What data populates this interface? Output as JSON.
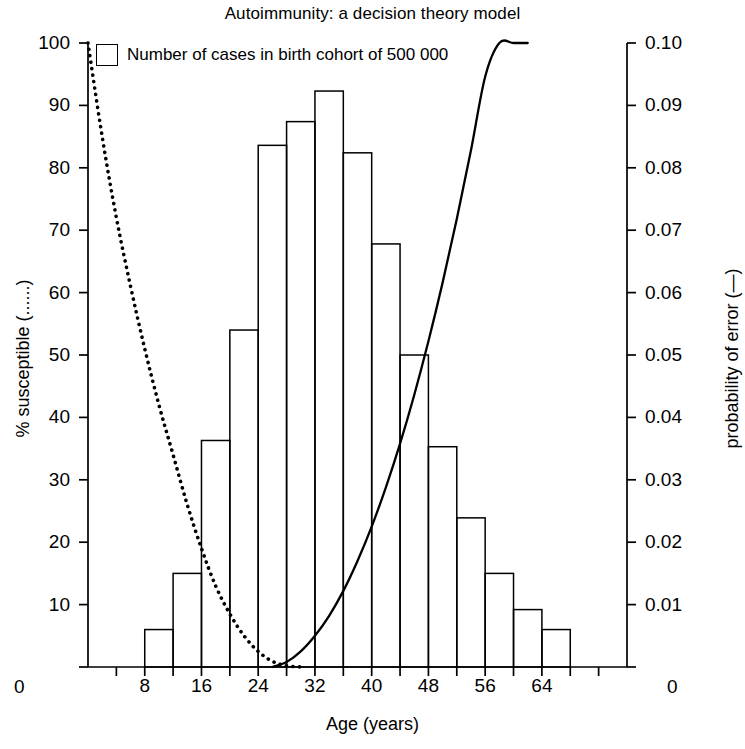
{
  "chart_data": {
    "type": "bar",
    "title": "Autoimmunity: a decision theory model",
    "xlabel": "Age (years)",
    "ylabel_left": "% susceptible (......)",
    "ylabel_right": "probability of error (—)",
    "grid": false,
    "legend_position": "top-left",
    "legend": [
      {
        "label": "Number of cases in birth cohort of 500 000",
        "marker": "open-rectangle"
      }
    ],
    "xlim": [
      0,
      76
    ],
    "xticks": [
      0,
      4,
      8,
      12,
      16,
      20,
      24,
      28,
      32,
      36,
      40,
      44,
      48,
      52,
      56,
      60,
      64,
      68,
      72,
      76
    ],
    "xtick_labels": [
      "8",
      "16",
      "24",
      "32",
      "40",
      "48",
      "56",
      "64"
    ],
    "xtick_label_values": [
      8,
      16,
      24,
      32,
      40,
      48,
      56,
      64
    ],
    "x_axis_zero_left": "0",
    "x_axis_zero_right": "0",
    "ylim_left": [
      0,
      100
    ],
    "yticks_left": [
      0,
      10,
      20,
      30,
      40,
      50,
      60,
      70,
      80,
      90,
      100
    ],
    "ytick_labels_left": [
      "0",
      "10",
      "20",
      "30",
      "40",
      "50",
      "60",
      "70",
      "80",
      "90",
      "100"
    ],
    "ylim_right": [
      0,
      0.1
    ],
    "yticks_right": [
      0,
      0.01,
      0.02,
      0.03,
      0.04,
      0.05,
      0.06,
      0.07,
      0.08,
      0.09,
      0.1
    ],
    "ytick_labels_right": [
      "0",
      "0.01",
      "0.02",
      "0.03",
      "0.04",
      "0.05",
      "0.06",
      "0.07",
      "0.08",
      "0.09",
      "0.10"
    ],
    "bar_series": {
      "name": "Number of cases in birth cohort of 500 000",
      "bin_width": 4,
      "axis": "left",
      "bins": [
        {
          "x_start": 8,
          "x_end": 12,
          "value": 6.0
        },
        {
          "x_start": 12,
          "x_end": 16,
          "value": 15.0
        },
        {
          "x_start": 16,
          "x_end": 20,
          "value": 36.3
        },
        {
          "x_start": 20,
          "x_end": 24,
          "value": 54.0
        },
        {
          "x_start": 24,
          "x_end": 28,
          "value": 83.6
        },
        {
          "x_start": 28,
          "x_end": 32,
          "value": 87.4
        },
        {
          "x_start": 32,
          "x_end": 36,
          "value": 92.3
        },
        {
          "x_start": 36,
          "x_end": 40,
          "value": 82.4
        },
        {
          "x_start": 40,
          "x_end": 44,
          "value": 67.8
        },
        {
          "x_start": 44,
          "x_end": 48,
          "value": 50.0
        },
        {
          "x_start": 48,
          "x_end": 52,
          "value": 35.3
        },
        {
          "x_start": 52,
          "x_end": 56,
          "value": 23.9
        },
        {
          "x_start": 56,
          "x_end": 60,
          "value": 15.0
        },
        {
          "x_start": 60,
          "x_end": 64,
          "value": 9.2
        },
        {
          "x_start": 64,
          "x_end": 68,
          "value": 6.0
        }
      ]
    },
    "line_series": [
      {
        "name": "% susceptible",
        "style": "dotted",
        "axis": "left",
        "x": [
          0,
          2,
          4,
          6,
          8,
          10,
          12,
          14,
          16,
          18,
          20,
          22,
          24,
          26,
          28,
          30
        ],
        "values": [
          100,
          85,
          72,
          61,
          51,
          42,
          34,
          26,
          19,
          13,
          8.5,
          5,
          2.5,
          0.9,
          0.2,
          0
        ]
      },
      {
        "name": "probability of error",
        "style": "solid",
        "axis": "right",
        "x": [
          26,
          28,
          30,
          32,
          34,
          36,
          38,
          40,
          42,
          44,
          46,
          48,
          50,
          52,
          54,
          56,
          58,
          60,
          62
        ],
        "values": [
          0.0,
          0.0008,
          0.0025,
          0.005,
          0.0082,
          0.0122,
          0.017,
          0.0225,
          0.0288,
          0.0358,
          0.0436,
          0.0522,
          0.0616,
          0.0718,
          0.0828,
          0.0946,
          0.1,
          0.1,
          0.1
        ]
      }
    ]
  }
}
